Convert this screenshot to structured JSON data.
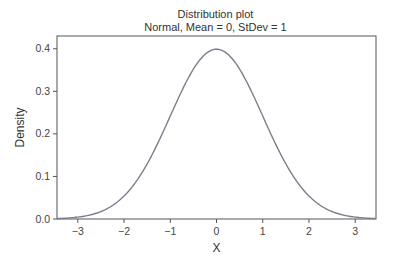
{
  "chart_data": {
    "type": "line",
    "title": "Distribution plot",
    "subtitle": "Normal, Mean = 0, StDev = 1",
    "xlabel": "X",
    "ylabel": "Density",
    "xlim": [
      -3.45,
      3.45
    ],
    "ylim": [
      0.0,
      0.43
    ],
    "xticks": [
      -3,
      -2,
      -1,
      0,
      1,
      2,
      3
    ],
    "xtick_labels": [
      "−3",
      "−2",
      "−1",
      "0",
      "1",
      "2",
      "3"
    ],
    "yticks": [
      0.0,
      0.1,
      0.2,
      0.3,
      0.4
    ],
    "ytick_labels": [
      "0.0",
      "0.1",
      "0.2",
      "0.3",
      "0.4"
    ],
    "grid": false,
    "legend": null,
    "series": [
      {
        "name": "Normal(0,1) pdf",
        "color": "#7a7f8c",
        "x": [
          -3.45,
          -3.0,
          -2.5,
          -2.0,
          -1.5,
          -1.0,
          -0.5,
          0.0,
          0.5,
          1.0,
          1.5,
          2.0,
          2.5,
          3.0,
          3.45
        ],
        "y": [
          0.001,
          0.0044,
          0.0175,
          0.054,
          0.1295,
          0.242,
          0.3521,
          0.3989,
          0.3521,
          0.242,
          0.1295,
          0.054,
          0.0175,
          0.0044,
          0.001
        ]
      }
    ],
    "distribution": {
      "family": "Normal",
      "mean": 0,
      "stdev": 1
    }
  }
}
